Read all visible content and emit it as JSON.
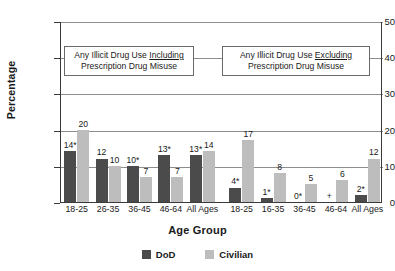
{
  "chart_data": {
    "type": "bar",
    "title": "",
    "xlabel": "Age Group",
    "ylabel": "Percentage",
    "ylim": [
      0,
      50
    ],
    "yticks": [
      0,
      10,
      20,
      30,
      40,
      50
    ],
    "grid": "horizontal",
    "legend_position": "bottom",
    "categories": [
      "18-25",
      "26-35",
      "36-45",
      "46-64",
      "All Ages",
      "18-25",
      "16-35",
      "36-45",
      "46-64",
      "All Ages"
    ],
    "series": [
      {
        "name": "DoD",
        "color": "#4b4b4b",
        "values": [
          14,
          12,
          10,
          13,
          13,
          4,
          1,
          0,
          null,
          2
        ],
        "labels": [
          "14*",
          "12",
          "10*",
          "13*",
          "13*",
          "4*",
          "1*",
          "0*",
          "+",
          "2*"
        ]
      },
      {
        "name": "Civilian",
        "color": "#bdbdbd",
        "values": [
          20,
          10,
          7,
          7,
          14,
          17,
          8,
          5,
          6,
          12
        ],
        "labels": [
          "20",
          "10",
          "7",
          "7",
          "14",
          "17",
          "8",
          "5",
          "6",
          "12"
        ]
      }
    ],
    "panels": [
      {
        "annotation_line1_prefix": "Any Illicit Drug Use ",
        "annotation_line1_emphasis": "Including",
        "annotation_line2": "Prescription Drug Misuse"
      },
      {
        "annotation_line1_prefix": "Any Illicit Drug Use ",
        "annotation_line1_emphasis": "Excluding",
        "annotation_line2": "Prescription Drug Misuse"
      }
    ]
  },
  "legend": {
    "items": [
      {
        "label": "DoD",
        "color": "#4b4b4b"
      },
      {
        "label": "Civilian",
        "color": "#bdbdbd"
      }
    ]
  }
}
